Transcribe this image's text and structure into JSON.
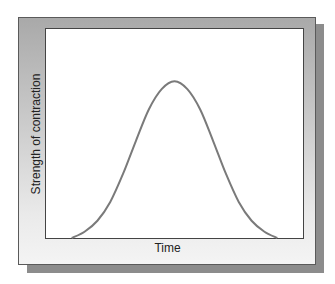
{
  "chart_data": {
    "type": "line",
    "title": "",
    "xlabel": "Time",
    "ylabel": "Strength of contraction",
    "xlim": [
      0,
      1
    ],
    "ylim": [
      0,
      1
    ],
    "grid": false,
    "legend": "none",
    "x_ticks": [],
    "y_ticks": [],
    "series": [
      {
        "name": "contraction",
        "color": "#7a7a7a",
        "x": [
          0.1,
          0.15,
          0.2,
          0.25,
          0.3,
          0.35,
          0.4,
          0.45,
          0.5,
          0.55,
          0.6,
          0.65,
          0.7,
          0.75,
          0.8,
          0.85,
          0.9
        ],
        "y": [
          0.0,
          0.04,
          0.11,
          0.23,
          0.41,
          0.62,
          0.82,
          0.95,
          1.0,
          0.95,
          0.82,
          0.62,
          0.41,
          0.23,
          0.11,
          0.04,
          0.0
        ]
      }
    ],
    "peak_fraction_of_axis": 0.75
  }
}
